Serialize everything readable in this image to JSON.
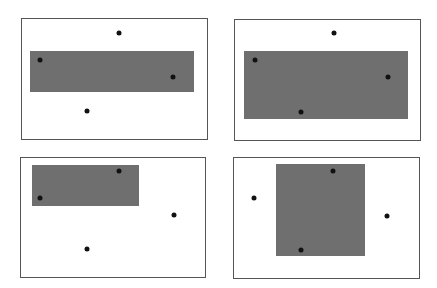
{
  "figure": {
    "panels": [
      {
        "id": "top-left",
        "frame": {
          "x": 21,
          "y": 18,
          "w": 187,
          "h": 122
        },
        "rect": {
          "x": 30,
          "y": 51,
          "w": 164,
          "h": 41
        },
        "points": [
          [
            119,
            33
          ],
          [
            40,
            60
          ],
          [
            173,
            77
          ],
          [
            87,
            111
          ]
        ]
      },
      {
        "id": "top-right",
        "frame": {
          "x": 234,
          "y": 19,
          "w": 187,
          "h": 122
        },
        "rect": {
          "x": 244,
          "y": 51,
          "w": 164,
          "h": 68
        },
        "points": [
          [
            334,
            33
          ],
          [
            255,
            60
          ],
          [
            388,
            77
          ],
          [
            301,
            112
          ]
        ]
      },
      {
        "id": "bottom-left",
        "frame": {
          "x": 20,
          "y": 157,
          "w": 186,
          "h": 121
        },
        "rect": {
          "x": 32,
          "y": 165,
          "w": 107,
          "h": 41
        },
        "points": [
          [
            119,
            171
          ],
          [
            40,
            198
          ],
          [
            174,
            215
          ],
          [
            87,
            249
          ]
        ]
      },
      {
        "id": "bottom-right",
        "frame": {
          "x": 233,
          "y": 157,
          "w": 187,
          "h": 122
        },
        "rect": {
          "x": 276,
          "y": 164,
          "w": 89,
          "h": 92
        },
        "points": [
          [
            333,
            171
          ],
          [
            254,
            198
          ],
          [
            387,
            216
          ],
          [
            301,
            250
          ]
        ]
      }
    ],
    "colors": {
      "rect": "#6f6f6f",
      "point": "#111111",
      "border": "#555555"
    }
  }
}
